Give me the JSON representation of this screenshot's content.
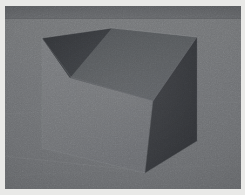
{
  "scene": {
    "kind": "3d-render",
    "subject": "cube on ground plane",
    "frame_color": "#e9e9e7",
    "frame_inset_px": 5,
    "canvas": {
      "width": 245,
      "height": 195
    },
    "render_area": {
      "x": 5,
      "y": 6,
      "width": 236,
      "height": 183
    },
    "background": {
      "sky_band_color": "#5f6164",
      "horizon_y": 12,
      "ground_near_color": "#6b6d6f",
      "ground_far_color": "#737577",
      "ground_label": "ground-plane"
    },
    "object": {
      "name": "cube",
      "faces": [
        {
          "name": "top-face",
          "color": "#55585b",
          "points": "37,32 107,22 192,31 148,95 65,72"
        },
        {
          "name": "top-left-shadow-wedge",
          "color": "#36383b",
          "points": "37,32 107,22 65,72"
        },
        {
          "name": "front-left-face",
          "color": "#707275",
          "points": "37,32 65,72 140,167 140,167 37,142"
        },
        {
          "name": "front-left-face-lower",
          "color": "#74767a",
          "points": "37,32 37,142 140,167 65,72"
        },
        {
          "name": "right-face",
          "color": "#3a3c40",
          "points": "148,95 192,31 192,135 140,167"
        }
      ],
      "edges": [
        {
          "name": "edge-top-left",
          "from": "37,32",
          "to": "107,22"
        },
        {
          "name": "edge-top-right",
          "from": "107,22",
          "to": "192,31"
        },
        {
          "name": "edge-top-inner-l",
          "from": "37,32",
          "to": "65,72"
        },
        {
          "name": "edge-top-inner-r",
          "from": "65,72",
          "to": "148,95"
        },
        {
          "name": "edge-top-inner-d",
          "from": "148,95",
          "to": "192,31"
        },
        {
          "name": "edge-vertical-left",
          "from": "37,32",
          "to": "37,142"
        },
        {
          "name": "edge-vertical-mid",
          "from": "140,167",
          "to": "148,95"
        },
        {
          "name": "edge-vertical-right",
          "from": "192,31",
          "to": "192,135"
        },
        {
          "name": "edge-bottom-left",
          "from": "37,142",
          "to": "140,167"
        },
        {
          "name": "edge-bottom-right",
          "from": "140,167",
          "to": "192,135"
        }
      ]
    },
    "ground_marks": [
      {
        "name": "ground-streak-far",
        "from": "0,108",
        "to": "236,96"
      },
      {
        "name": "ground-streak-near",
        "from": "0,150",
        "to": "120,163"
      },
      {
        "name": "ground-streak-low",
        "from": "0,170",
        "to": "236,158"
      }
    ]
  }
}
